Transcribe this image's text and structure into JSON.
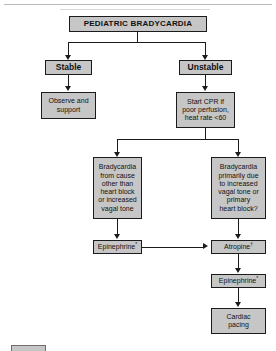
{
  "figure": {
    "title": "PEDIATRIC BRADYCARDIA",
    "nodes": {
      "title_box": "PEDIATRIC BRADYCARDIA",
      "stable": "Stable",
      "unstable": "Unstable",
      "observe": "Observe and\nsupport",
      "start_cpr": "Start CPR if\npoor perfusion,\nheat rate <60",
      "brady_other": "Bradycardia\nfrom cause\nother than\nheart block\nor increased\nvagal tone",
      "brady_vagal": "Bradycardia\nprimarily due\nto increased\nvagal tone or\nprimary\nheart block?",
      "epinephrine_left": "Epinephrine",
      "epinephrine_left_mark": "*",
      "atropine": "Atropine",
      "atropine_mark": "†",
      "epinephrine_right": "Epinephrine",
      "epinephrine_right_mark": "*",
      "cardiac_pacing": "Cardiac\npacing"
    },
    "colors": {
      "box_fill": "#c6c6c6",
      "box_border": "#1b1b1b",
      "text": "#111111",
      "background": "#ffffff"
    }
  }
}
